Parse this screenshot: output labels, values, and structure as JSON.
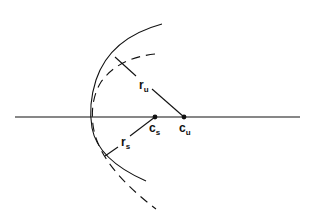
{
  "diagram": {
    "colors": {
      "stroke": "#111111",
      "background": "#ffffff"
    },
    "axis": {
      "x1": 15,
      "y": 117,
      "x2": 300
    },
    "points": [
      {
        "id": "cs",
        "label_main": "c",
        "label_sub": "s",
        "x": 155,
        "y": 117
      },
      {
        "id": "cu",
        "label_main": "c",
        "label_sub": "u",
        "x": 184,
        "y": 117
      }
    ],
    "radii": [
      {
        "id": "ru",
        "label_main": "r",
        "label_sub": "u",
        "from": [
          115,
          57
        ],
        "to": [
          184,
          117
        ]
      },
      {
        "id": "rs",
        "label_main": "r",
        "label_sub": "s",
        "from": [
          105,
          156
        ],
        "to": [
          155,
          117
        ]
      }
    ],
    "arcs": [
      {
        "id": "solid-arc",
        "style": "solid"
      },
      {
        "id": "dashed-arc",
        "style": "dashed"
      }
    ]
  }
}
